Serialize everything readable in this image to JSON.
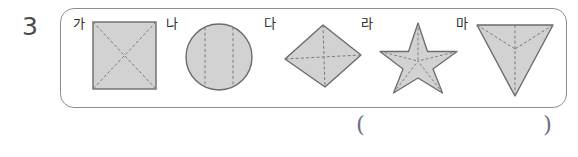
{
  "problem": {
    "number": "3",
    "answer_blank": {
      "open_paren": "(",
      "close_paren": ")"
    }
  },
  "shapes_box": {
    "border_color": "#8e8e8e",
    "items": [
      {
        "label": "가",
        "shape": "square",
        "shape_name": "square-shape",
        "fill": "#d2d2d2",
        "outline": "#6b6b6b",
        "dashed_lines": 2,
        "dashed_line_kind": "diagonals",
        "dash_color": "#7a7a7a"
      },
      {
        "label": "나",
        "shape": "circle",
        "shape_name": "circle-shape",
        "fill": "#d2d2d2",
        "outline": "#6b6b6b",
        "dashed_lines": 2,
        "dashed_line_kind": "vertical-chords",
        "dash_color": "#7a7a7a"
      },
      {
        "label": "다",
        "shape": "diamond",
        "shape_name": "diamond-shape",
        "fill": "#d2d2d2",
        "outline": "#6b6b6b",
        "dashed_lines": 2,
        "dashed_line_kind": "from-top-vertex",
        "dash_color": "#7a7a7a"
      },
      {
        "label": "라",
        "shape": "star",
        "shape_name": "star-shape",
        "fill": "#d2d2d2",
        "outline": "#6b6b6b",
        "dashed_lines": 5,
        "dashed_line_kind": "points-to-center",
        "dash_color": "#7a7a7a"
      },
      {
        "label": "마",
        "shape": "inverted-triangle",
        "shape_name": "inverted-triangle-shape",
        "fill": "#d2d2d2",
        "outline": "#6b6b6b",
        "dashed_lines": 3,
        "dashed_line_kind": "vertices-to-center",
        "dash_color": "#7a7a7a"
      }
    ]
  }
}
